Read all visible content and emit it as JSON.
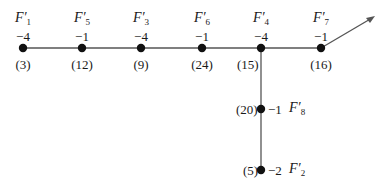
{
  "diagram": {
    "type": "weighted dual graph",
    "edge_color": "#555555",
    "node_color": "#111111",
    "nodes": [
      {
        "id": "F1",
        "name": "F",
        "sub": "1",
        "prime": "′",
        "self_int": "−4",
        "mult": "(3)",
        "x": 23,
        "y": 48
      },
      {
        "id": "F5",
        "name": "F",
        "sub": "5",
        "prime": "′",
        "self_int": "−1",
        "mult": "(12)",
        "x": 82,
        "y": 48
      },
      {
        "id": "F3",
        "name": "F",
        "sub": "3",
        "prime": "′",
        "self_int": "−4",
        "mult": "(9)",
        "x": 141,
        "y": 48
      },
      {
        "id": "F6",
        "name": "F",
        "sub": "6",
        "prime": "′",
        "self_int": "−1",
        "mult": "(24)",
        "x": 202,
        "y": 48
      },
      {
        "id": "F4",
        "name": "F",
        "sub": "4",
        "prime": "′",
        "self_int": "−4",
        "mult": "(15)",
        "x": 261,
        "y": 48
      },
      {
        "id": "F7",
        "name": "F",
        "sub": "7",
        "prime": "′",
        "self_int": "−1",
        "mult": "(16)",
        "x": 321,
        "y": 48
      },
      {
        "id": "F8",
        "name": "F",
        "sub": "8",
        "prime": "′",
        "self_int": "−1",
        "mult": "(20)",
        "x": 261,
        "y": 109
      },
      {
        "id": "F2",
        "name": "F",
        "sub": "2",
        "prime": "′",
        "self_int": "−2",
        "mult": "(5)",
        "x": 261,
        "y": 170
      }
    ],
    "edges": [
      [
        "F1",
        "F5"
      ],
      [
        "F5",
        "F3"
      ],
      [
        "F3",
        "F6"
      ],
      [
        "F6",
        "F4"
      ],
      [
        "F4",
        "F7"
      ],
      [
        "F4",
        "F8"
      ],
      [
        "F8",
        "F2"
      ]
    ],
    "arrow": {
      "from": "F7",
      "to_x": 373,
      "to_y": 17
    }
  }
}
